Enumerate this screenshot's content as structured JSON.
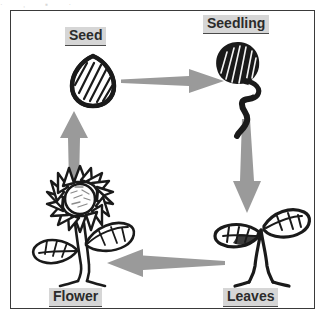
{
  "diagram": {
    "type": "plant-life-cycle",
    "title": "",
    "frame": {
      "border_color": "#3a3a3a",
      "background": "#ffffff"
    },
    "arrow_color": "#9a9a9a",
    "label_background": "#d6d6d6",
    "label_text_color": "#2b2b2b",
    "artwork_color": "#1a1a1a",
    "stages": [
      {
        "id": "seed",
        "label": "Seed",
        "icon": "seed-icon",
        "position": "top-left"
      },
      {
        "id": "seedling",
        "label": "Seedling",
        "icon": "seedling-icon",
        "position": "top-right"
      },
      {
        "id": "leaves",
        "label": "Leaves",
        "icon": "leaves-plant-icon",
        "position": "bottom-right"
      },
      {
        "id": "flower",
        "label": "Flower",
        "icon": "sunflower-icon",
        "position": "bottom-left"
      }
    ],
    "arrows": [
      {
        "id": "seed-to-seedling",
        "from": "seed",
        "to": "seedling",
        "direction": "right"
      },
      {
        "id": "seedling-to-leaves",
        "from": "seedling",
        "to": "leaves",
        "direction": "down"
      },
      {
        "id": "leaves-to-flower",
        "from": "leaves",
        "to": "flower",
        "direction": "left"
      },
      {
        "id": "flower-to-seed",
        "from": "flower",
        "to": "seed",
        "direction": "up"
      }
    ],
    "scan_artifact_text": "· , ▪ ·"
  }
}
